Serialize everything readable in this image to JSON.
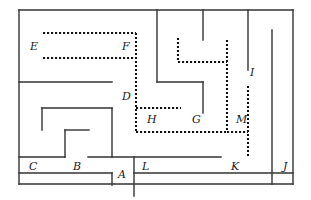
{
  "figure": {
    "width": 311,
    "height": 200,
    "background_color": "#ffffff",
    "stroke_color": "#333333",
    "dotted_stroke_color": "#111111"
  },
  "labels": [
    {
      "id": "E",
      "text": "E",
      "x": 30,
      "y": 50
    },
    {
      "id": "F",
      "text": "F",
      "x": 122,
      "y": 50
    },
    {
      "id": "D",
      "text": "D",
      "x": 122,
      "y": 100
    },
    {
      "id": "H",
      "text": "H",
      "x": 147,
      "y": 123
    },
    {
      "id": "G",
      "text": "G",
      "x": 192,
      "y": 123
    },
    {
      "id": "I",
      "text": "I",
      "x": 250,
      "y": 76
    },
    {
      "id": "M",
      "text": "M",
      "x": 236,
      "y": 123
    },
    {
      "id": "C",
      "text": "C",
      "x": 29,
      "y": 170
    },
    {
      "id": "B",
      "text": "B",
      "x": 73,
      "y": 170
    },
    {
      "id": "A",
      "text": "A",
      "x": 118,
      "y": 178
    },
    {
      "id": "L",
      "text": "L",
      "x": 142,
      "y": 170
    },
    {
      "id": "K",
      "text": "K",
      "x": 231,
      "y": 170
    },
    {
      "id": "J",
      "text": "J",
      "x": 283,
      "y": 170
    }
  ],
  "solid_walls": [
    {
      "name": "outer-border-top",
      "x1": 19,
      "y1": 10,
      "x2": 293,
      "y2": 10
    },
    {
      "name": "outer-border-left",
      "x1": 19,
      "y1": 10,
      "x2": 19,
      "y2": 184
    },
    {
      "name": "outer-border-right",
      "x1": 293,
      "y1": 10,
      "x2": 293,
      "y2": 184
    },
    {
      "name": "outer-border-bottom",
      "x1": 19,
      "y1": 184,
      "x2": 293,
      "y2": 184
    },
    {
      "name": "wall-top-vertical-left",
      "x1": 157,
      "y1": 10,
      "x2": 157,
      "y2": 82
    },
    {
      "name": "wall-top-vertical-mid",
      "x1": 203,
      "y1": 10,
      "x2": 203,
      "y2": 40
    },
    {
      "name": "wall-i-vertical",
      "x1": 248,
      "y1": 10,
      "x2": 248,
      "y2": 70
    },
    {
      "name": "wall-j-vertical",
      "x1": 272,
      "y1": 30,
      "x2": 272,
      "y2": 184
    },
    {
      "name": "wall-e-lower-horizontal",
      "x1": 19,
      "y1": 82,
      "x2": 112,
      "y2": 82
    },
    {
      "name": "wall-g-horizontal",
      "x1": 157,
      "y1": 82,
      "x2": 203,
      "y2": 82
    },
    {
      "name": "wall-g-vertical",
      "x1": 203,
      "y1": 82,
      "x2": 203,
      "y2": 113
    },
    {
      "name": "wall-b-top-horizontal",
      "x1": 42,
      "y1": 108,
      "x2": 112,
      "y2": 108
    },
    {
      "name": "wall-b-left-vertical",
      "x1": 42,
      "y1": 108,
      "x2": 42,
      "y2": 130
    },
    {
      "name": "wall-b-right-vertical",
      "x1": 112,
      "y1": 108,
      "x2": 112,
      "y2": 157
    },
    {
      "name": "wall-b-inner-horizontal",
      "x1": 65,
      "y1": 130,
      "x2": 89,
      "y2": 130
    },
    {
      "name": "wall-b-inner-vertical",
      "x1": 65,
      "y1": 130,
      "x2": 65,
      "y2": 157
    },
    {
      "name": "wall-c-horizontal",
      "x1": 19,
      "y1": 157,
      "x2": 65,
      "y2": 157
    },
    {
      "name": "wall-l-horizontal",
      "x1": 88,
      "y1": 157,
      "x2": 221,
      "y2": 157
    },
    {
      "name": "wall-a-vertical",
      "x1": 134,
      "y1": 157,
      "x2": 134,
      "y2": 196
    },
    {
      "name": "wall-a-horizontal",
      "x1": 19,
      "y1": 173,
      "x2": 112,
      "y2": 173
    },
    {
      "name": "wall-a-stub-vertical",
      "x1": 112,
      "y1": 173,
      "x2": 112,
      "y2": 185
    },
    {
      "name": "wall-k-horizontal",
      "x1": 134,
      "y1": 173,
      "x2": 293,
      "y2": 173
    }
  ],
  "dotted_walls": [
    {
      "name": "dotted-ef-top",
      "x1": 43,
      "y1": 33,
      "x2": 136,
      "y2": 33
    },
    {
      "name": "dotted-ef-bottom",
      "x1": 43,
      "y1": 58,
      "x2": 136,
      "y2": 58
    },
    {
      "name": "dotted-d-vertical",
      "x1": 136,
      "y1": 33,
      "x2": 136,
      "y2": 132
    },
    {
      "name": "dotted-h-horizontal",
      "x1": 136,
      "y1": 108,
      "x2": 181,
      "y2": 108
    },
    {
      "name": "dotted-bottom-long",
      "x1": 136,
      "y1": 132,
      "x2": 227,
      "y2": 132
    },
    {
      "name": "dotted-m-vertical",
      "x1": 227,
      "y1": 40,
      "x2": 227,
      "y2": 132
    },
    {
      "name": "dotted-u-left",
      "x1": 178,
      "y1": 38,
      "x2": 178,
      "y2": 62
    },
    {
      "name": "dotted-u-bottom",
      "x1": 178,
      "y1": 62,
      "x2": 227,
      "y2": 62
    },
    {
      "name": "dotted-m-to-i",
      "x1": 227,
      "y1": 132,
      "x2": 248,
      "y2": 132
    },
    {
      "name": "dotted-i-lower-vert",
      "x1": 248,
      "y1": 86,
      "x2": 248,
      "y2": 157
    }
  ]
}
